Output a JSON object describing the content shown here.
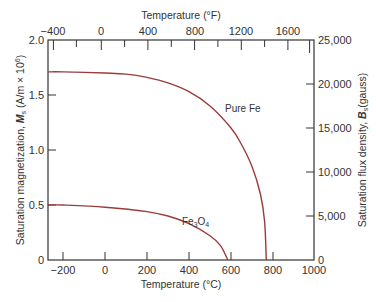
{
  "chart_data": {
    "type": "line",
    "title": "",
    "xlabel": "Temperature (°C)",
    "x2label": "Temperature (°F)",
    "ylabel": "Saturation magnetization, M_s (A/m × 10^6)",
    "y2label": "Saturation flux density, B_s (gauss)",
    "xlim": [
      -273,
      1000
    ],
    "ylim": [
      0,
      2.0
    ],
    "y2lim": [
      0,
      25000
    ],
    "x_ticks": [
      "-200",
      "0",
      "200",
      "400",
      "600",
      "800",
      "1000"
    ],
    "x_tick_values": [
      -200,
      0,
      200,
      400,
      600,
      800,
      1000
    ],
    "x2_ticks": [
      "-400",
      "0",
      "400",
      "800",
      "1200",
      "1600"
    ],
    "x2_tick_values_F": [
      -400,
      0,
      400,
      800,
      1200,
      1600
    ],
    "y_ticks": [
      "0",
      "0.5",
      "1.0",
      "1.5",
      "2.0"
    ],
    "y_tick_values": [
      0,
      0.5,
      1.0,
      1.5,
      2.0
    ],
    "y2_ticks": [
      "0",
      "5,000",
      "10,000",
      "15,000",
      "20,000",
      "25,000"
    ],
    "y2_tick_values": [
      0,
      5000,
      10000,
      15000,
      20000,
      25000
    ],
    "grid": false,
    "series": [
      {
        "name": "Pure Fe",
        "color": "#9b3b3b",
        "x": [
          -273,
          -200,
          0,
          100,
          200,
          300,
          400,
          500,
          600,
          650,
          700,
          740,
          760,
          768
        ],
        "values": [
          1.71,
          1.71,
          1.7,
          1.69,
          1.66,
          1.61,
          1.53,
          1.4,
          1.2,
          1.05,
          0.85,
          0.6,
          0.35,
          0
        ]
      },
      {
        "name": "Fe3O4",
        "color": "#9b3b3b",
        "x": [
          -273,
          -200,
          0,
          200,
          300,
          400,
          500,
          550,
          585
        ],
        "values": [
          0.5,
          0.5,
          0.48,
          0.44,
          0.4,
          0.33,
          0.22,
          0.13,
          0
        ]
      }
    ],
    "annotations": [
      {
        "text": "Pure Fe",
        "x": 560,
        "y": 1.37
      },
      {
        "text": "Fe3O4",
        "x": 360,
        "y": 0.27
      }
    ]
  },
  "labels": {
    "x_title": "Temperature (°C)",
    "x2_title": "Temperature (°F)",
    "y_title_prefix": "Saturation magnetization, ",
    "y_title_symbol": "M",
    "y_title_sub": "s",
    "y_title_suffix": " (A/m × 10",
    "y_title_exp": "6",
    "y_title_end": ")",
    "y2_title_prefix": "Saturation flux density, ",
    "y2_title_symbol": "B",
    "y2_title_sub": "s",
    "y2_title_suffix": "(gauss)",
    "pure_fe": "Pure Fe",
    "fe3o4_base": "Fe",
    "fe3o4_sub1": "3",
    "fe3o4_mid": "O",
    "fe3o4_sub2": "4"
  },
  "ticks": {
    "x": [
      "−200",
      "0",
      "200",
      "400",
      "600",
      "800",
      "1000"
    ],
    "x2": [
      "−400",
      "0",
      "400",
      "800",
      "1200",
      "1600"
    ],
    "y": [
      "0",
      "0.5",
      "1.0",
      "1.5",
      "2.0"
    ],
    "y2": [
      "0",
      "5,000",
      "10,000",
      "15,000",
      "20,000",
      "25,000"
    ]
  }
}
